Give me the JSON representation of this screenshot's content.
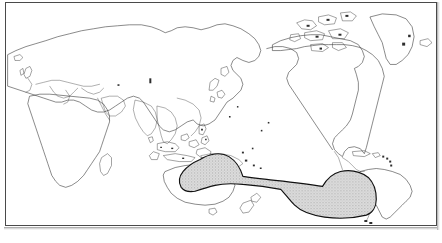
{
  "figure": {
    "type": "distribution-map",
    "projection": "equirectangular, Pacific-centred",
    "frame_visible": true,
    "caption": ""
  },
  "colors": {
    "background": "#ffffff",
    "coastline": "#2b2b2b",
    "frame": "#4a4a4a",
    "range_fill": "#d6d6d6",
    "range_stipple": "#b4b4b4",
    "range_outline": "#111111",
    "scan_shadow": "#9a9a9a"
  },
  "map": {
    "frame": {
      "x": 5,
      "y": 2,
      "width": 432,
      "height": 224
    },
    "landmasses": [
      {
        "name": "Africa",
        "data_name": "landmass-africa"
      },
      {
        "name": "Europe",
        "data_name": "landmass-europe"
      },
      {
        "name": "Asia",
        "data_name": "landmass-asia"
      },
      {
        "name": "Arabia",
        "data_name": "landmass-arabia"
      },
      {
        "name": "India",
        "data_name": "landmass-india"
      },
      {
        "name": "Southeast Asia",
        "data_name": "landmass-southeast-asia"
      },
      {
        "name": "Indonesia",
        "data_name": "landmass-indonesia"
      },
      {
        "name": "Philippines",
        "data_name": "landmass-philippines"
      },
      {
        "name": "Japan",
        "data_name": "landmass-japan"
      },
      {
        "name": "New Guinea",
        "data_name": "landmass-new-guinea"
      },
      {
        "name": "Australia",
        "data_name": "landmass-australia"
      },
      {
        "name": "Tasmania",
        "data_name": "landmass-tasmania"
      },
      {
        "name": "New Zealand",
        "data_name": "landmass-new-zealand"
      },
      {
        "name": "North America",
        "data_name": "landmass-north-america"
      },
      {
        "name": "Central America",
        "data_name": "landmass-central-america"
      },
      {
        "name": "South America",
        "data_name": "landmass-south-america"
      },
      {
        "name": "Greenland",
        "data_name": "landmass-greenland"
      },
      {
        "name": "Canadian Arctic Archipelago",
        "data_name": "landmass-canadian-arctic"
      },
      {
        "name": "Iceland",
        "data_name": "landmass-iceland"
      },
      {
        "name": "British Isles",
        "data_name": "landmass-british-isles"
      },
      {
        "name": "Madagascar",
        "data_name": "landmass-madagascar"
      },
      {
        "name": "Sri Lanka",
        "data_name": "landmass-sri-lanka"
      },
      {
        "name": "Caribbean islands",
        "data_name": "landmass-caribbean"
      },
      {
        "name": "Pacific islands",
        "data_name": "landmass-pacific-islands"
      }
    ],
    "distribution_range": {
      "label": "shaded distribution range",
      "description": "Stippled grey area from the Coral Sea / New Guinea eastward across the South Pacific, narrowing mid-ocean then widening again off southern South America to the coast of Chile.",
      "western_extent": "New Guinea / Coral Sea",
      "eastern_extent": "Coast of Chile, South America",
      "fill": "#d6d6d6",
      "outline": "#111111"
    }
  }
}
